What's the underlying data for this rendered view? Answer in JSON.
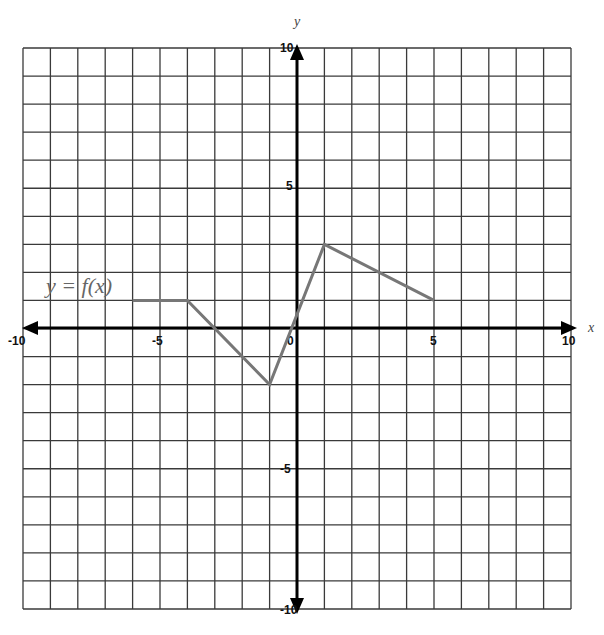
{
  "chart_data": {
    "type": "line",
    "title": "",
    "xlabel": "x",
    "ylabel": "y",
    "xlim": [
      -10,
      10
    ],
    "ylim": [
      -10,
      10
    ],
    "grid": true,
    "grid_step": 1,
    "x_tick_labels": [
      "-10",
      "-5",
      "0",
      "5",
      "10"
    ],
    "y_tick_labels": [
      "10",
      "5",
      "-5",
      "-10"
    ],
    "annotations": [
      "y = f(x)"
    ],
    "series": [
      {
        "name": "y = f(x)",
        "points": [
          [
            -6,
            1
          ],
          [
            -4,
            1
          ],
          [
            -1,
            -2
          ],
          [
            1,
            3
          ],
          [
            5,
            1
          ]
        ]
      }
    ]
  },
  "labels": {
    "x_axis": "x",
    "y_axis": "y",
    "function": "y = f(x)",
    "x_neg10": "-10",
    "x_neg5": "-5",
    "origin": "0",
    "x_pos5": "5",
    "x_pos10": "10",
    "y_pos10": "10",
    "y_pos5": "5",
    "y_neg5": "-5",
    "y_neg10": "-10"
  }
}
